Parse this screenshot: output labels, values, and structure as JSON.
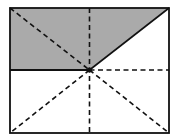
{
  "diagram": {
    "type": "geometric-figure",
    "colors": {
      "background": "#ffffff",
      "shade": "#aaaaaa",
      "stroke": "#111111"
    },
    "rect": {
      "x": 10,
      "y": 8,
      "w": 159,
      "h": 125
    },
    "center": {
      "x": 89.5,
      "y": 70
    }
  }
}
